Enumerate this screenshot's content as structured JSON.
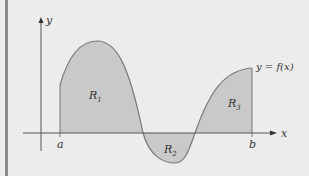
{
  "figure": {
    "background": "#ececec",
    "left_bar_color": "#8a8a8a",
    "region_fill": "#c9c9c9",
    "curve_color": "#7a7a7a",
    "axis_color": "#555555",
    "axes": {
      "x_label": "x",
      "y_label": "y"
    },
    "bounds": {
      "a_label": "a",
      "b_label": "b"
    },
    "curve_label": "y = f(x)",
    "regions": [
      {
        "label": "R",
        "sub": "1",
        "sign": "positive"
      },
      {
        "label": "R",
        "sub": "2",
        "sign": "negative"
      },
      {
        "label": "R",
        "sub": "3",
        "sign": "positive"
      }
    ]
  }
}
